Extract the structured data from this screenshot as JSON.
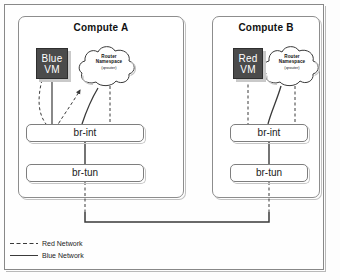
{
  "diagram": {
    "title_hidden": "",
    "hosts": [
      {
        "id": "compute-a",
        "title": "Compute A",
        "vm": {
          "line1": "Blue",
          "line2": "VM",
          "color": "#4b4b4b",
          "text_color": "#ffffff"
        },
        "router": {
          "line1": "Router",
          "line2": "Namespace",
          "line3": "(qrouter)"
        },
        "bridges": [
          {
            "id": "br-int",
            "label": "br-int"
          },
          {
            "id": "br-tun",
            "label": "br-tun"
          }
        ]
      },
      {
        "id": "compute-b",
        "title": "Compute B",
        "vm": {
          "line1": "Red",
          "line2": "VM",
          "color": "#4b4b4b",
          "text_color": "#ffffff"
        },
        "router": {
          "line1": "Router",
          "line2": "Namespace",
          "line3": "(qrouter)"
        },
        "bridges": [
          {
            "id": "br-int",
            "label": "br-int"
          },
          {
            "id": "br-tun",
            "label": "br-tun"
          }
        ]
      }
    ],
    "legend": {
      "items": [
        {
          "label": "Red Network",
          "style": "dashed",
          "color": "#3a3a3a"
        },
        {
          "label": "Blue Network",
          "style": "solid",
          "color": "#3a3a3a"
        }
      ]
    },
    "colors": {
      "frame_border": "#888888",
      "box_border": "#8d8d8d",
      "line": "#3a3a3a",
      "background": "#fdfdfd"
    }
  }
}
